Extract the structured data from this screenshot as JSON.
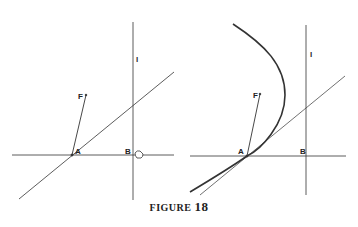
{
  "figure": {
    "caption_word": "FIGURE",
    "caption_number": "18"
  },
  "left_panel": {
    "labels": {
      "A": "A",
      "B": "B",
      "F": "F",
      "line": "l"
    },
    "icons": [
      "pointer-cursor-icon"
    ]
  },
  "right_panel": {
    "labels": {
      "A": "A",
      "B": "B",
      "F": "F",
      "line": "l"
    }
  },
  "colors": {
    "ink": "#333333",
    "background": "#ffffff"
  }
}
